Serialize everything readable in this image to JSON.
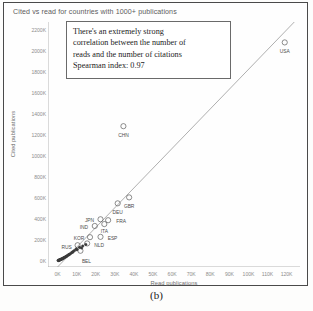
{
  "caption": "(b)",
  "chart_data": {
    "type": "scatter",
    "title": "Cited vs read for countries with 1000+ publications",
    "xlabel": "Read publications",
    "ylabel": "Cited publications",
    "xlim": [
      -5000,
      127000
    ],
    "ylim": [
      -60000,
      2280000
    ],
    "xticks": [
      "0K",
      "10K",
      "20K",
      "30K",
      "40K",
      "50K",
      "60K",
      "70K",
      "80K",
      "90K",
      "100K",
      "110K",
      "120K"
    ],
    "xtick_values": [
      0,
      10000,
      20000,
      30000,
      40000,
      50000,
      60000,
      70000,
      80000,
      90000,
      100000,
      110000,
      120000
    ],
    "yticks": [
      "0K",
      "200K",
      "400K",
      "600K",
      "800K",
      "1000K",
      "1200K",
      "1400K",
      "1600K",
      "1800K",
      "2000K",
      "2200K"
    ],
    "ytick_values": [
      0,
      200000,
      400000,
      600000,
      800000,
      1000000,
      1200000,
      1400000,
      1600000,
      1800000,
      2000000,
      2200000
    ],
    "grid": false,
    "legend": "none",
    "marker": "open-circle",
    "trendline": {
      "type": "linear",
      "x0": 0,
      "y0": -60000,
      "x1": 124000,
      "y1": 2280000
    },
    "annotation": {
      "lines": [
        "There's an extremely strong",
        "correlation between the number of",
        "reads and the number of citations",
        "Spearman index: 0.97"
      ],
      "spearman_index": 0.97
    },
    "points": [
      {
        "label": "USA",
        "x": 119000,
        "y": 2085000,
        "label_dx": 0,
        "label_dy": 7
      },
      {
        "label": "CHN",
        "x": 34500,
        "y": 1285000,
        "label_dx": 0,
        "label_dy": 7
      },
      {
        "label": "GBR",
        "x": 37500,
        "y": 605000,
        "label_dx": 0,
        "label_dy": 7
      },
      {
        "label": "DEU",
        "x": 31500,
        "y": 548000,
        "label_dx": 0,
        "label_dy": 7
      },
      {
        "label": "FRA",
        "x": 26500,
        "y": 387000,
        "label_dx": 13,
        "label_dy": -1
      },
      {
        "label": "JPN",
        "x": 22500,
        "y": 396000,
        "label_dx": -11,
        "label_dy": -1
      },
      {
        "label": "ITA",
        "x": 24500,
        "y": 350000,
        "label_dx": 0,
        "label_dy": 5
      },
      {
        "label": "IND",
        "x": 19500,
        "y": 332000,
        "label_dx": -11,
        "label_dy": -1
      },
      {
        "label": "ESP",
        "x": 22500,
        "y": 228000,
        "label_dx": 12,
        "label_dy": -1
      },
      {
        "label": "KOR",
        "x": 17000,
        "y": 225000,
        "label_dx": -11,
        "label_dy": -1
      },
      {
        "label": "NLD",
        "x": 15500,
        "y": 165000,
        "label_dx": 12,
        "label_dy": 0
      },
      {
        "label": "RUS",
        "x": 10500,
        "y": 148000,
        "label_dx": -11,
        "label_dy": 0
      },
      {
        "label": "BEL",
        "x": 12000,
        "y": 95000,
        "label_dx": 6,
        "label_dy": 8
      },
      {
        "label": "",
        "x": 13200,
        "y": 140000,
        "label_dx": 0,
        "label_dy": 0
      },
      {
        "label": "",
        "x": 11500,
        "y": 128000,
        "label_dx": 0,
        "label_dy": 0
      },
      {
        "label": "",
        "x": 9800,
        "y": 112000,
        "label_dx": 0,
        "label_dy": 0
      },
      {
        "label": "",
        "x": 8900,
        "y": 98000,
        "label_dx": 0,
        "label_dy": 0
      },
      {
        "label": "",
        "x": 8200,
        "y": 88000,
        "label_dx": 0,
        "label_dy": 0
      },
      {
        "label": "",
        "x": 7500,
        "y": 78000,
        "label_dx": 0,
        "label_dy": 0
      },
      {
        "label": "",
        "x": 6900,
        "y": 70000,
        "label_dx": 0,
        "label_dy": 0
      },
      {
        "label": "",
        "x": 6300,
        "y": 62000,
        "label_dx": 0,
        "label_dy": 0
      },
      {
        "label": "",
        "x": 5800,
        "y": 56000,
        "label_dx": 0,
        "label_dy": 0
      },
      {
        "label": "",
        "x": 5300,
        "y": 50000,
        "label_dx": 0,
        "label_dy": 0
      },
      {
        "label": "",
        "x": 4800,
        "y": 44000,
        "label_dx": 0,
        "label_dy": 0
      },
      {
        "label": "",
        "x": 4400,
        "y": 39000,
        "label_dx": 0,
        "label_dy": 0
      },
      {
        "label": "",
        "x": 4000,
        "y": 35000,
        "label_dx": 0,
        "label_dy": 0
      },
      {
        "label": "",
        "x": 3600,
        "y": 31000,
        "label_dx": 0,
        "label_dy": 0
      },
      {
        "label": "",
        "x": 3200,
        "y": 27000,
        "label_dx": 0,
        "label_dy": 0
      },
      {
        "label": "",
        "x": 2900,
        "y": 23500,
        "label_dx": 0,
        "label_dy": 0
      },
      {
        "label": "",
        "x": 2600,
        "y": 20500,
        "label_dx": 0,
        "label_dy": 0
      },
      {
        "label": "",
        "x": 2300,
        "y": 17500,
        "label_dx": 0,
        "label_dy": 0
      },
      {
        "label": "",
        "x": 2000,
        "y": 15000,
        "label_dx": 0,
        "label_dy": 0
      },
      {
        "label": "",
        "x": 1750,
        "y": 12500,
        "label_dx": 0,
        "label_dy": 0
      },
      {
        "label": "",
        "x": 1500,
        "y": 10500,
        "label_dx": 0,
        "label_dy": 0
      },
      {
        "label": "",
        "x": 1250,
        "y": 8500,
        "label_dx": 0,
        "label_dy": 0
      },
      {
        "label": "",
        "x": 1000,
        "y": 7000,
        "label_dx": 0,
        "label_dy": 0
      },
      {
        "label": "",
        "x": 800,
        "y": 5500,
        "label_dx": 0,
        "label_dy": 0
      },
      {
        "label": "",
        "x": 600,
        "y": 4000,
        "label_dx": 0,
        "label_dy": 0
      },
      {
        "label": "",
        "x": 450,
        "y": 3000,
        "label_dx": 0,
        "label_dy": 0
      },
      {
        "label": "",
        "x": 300,
        "y": 2000,
        "label_dx": 0,
        "label_dy": 0
      },
      {
        "label": "",
        "x": 14800,
        "y": 155000,
        "label_dx": 0,
        "label_dy": 0
      },
      {
        "label": "",
        "x": 12600,
        "y": 122000,
        "label_dx": 0,
        "label_dy": 0
      },
      {
        "label": "",
        "x": 10200,
        "y": 105000,
        "label_dx": 0,
        "label_dy": 0
      },
      {
        "label": "",
        "x": 7900,
        "y": 82000,
        "label_dx": 0,
        "label_dy": 0
      },
      {
        "label": "",
        "x": 6000,
        "y": 58000,
        "label_dx": 0,
        "label_dy": 0
      },
      {
        "label": "",
        "x": 4600,
        "y": 41000,
        "label_dx": 0,
        "label_dy": 0
      },
      {
        "label": "",
        "x": 3400,
        "y": 29000,
        "label_dx": 0,
        "label_dy": 0
      },
      {
        "label": "",
        "x": 2450,
        "y": 19000,
        "label_dx": 0,
        "label_dy": 0
      },
      {
        "label": "",
        "x": 1600,
        "y": 11500,
        "label_dx": 0,
        "label_dy": 0
      },
      {
        "label": "",
        "x": 1100,
        "y": 7800,
        "label_dx": 0,
        "label_dy": 0
      }
    ]
  }
}
